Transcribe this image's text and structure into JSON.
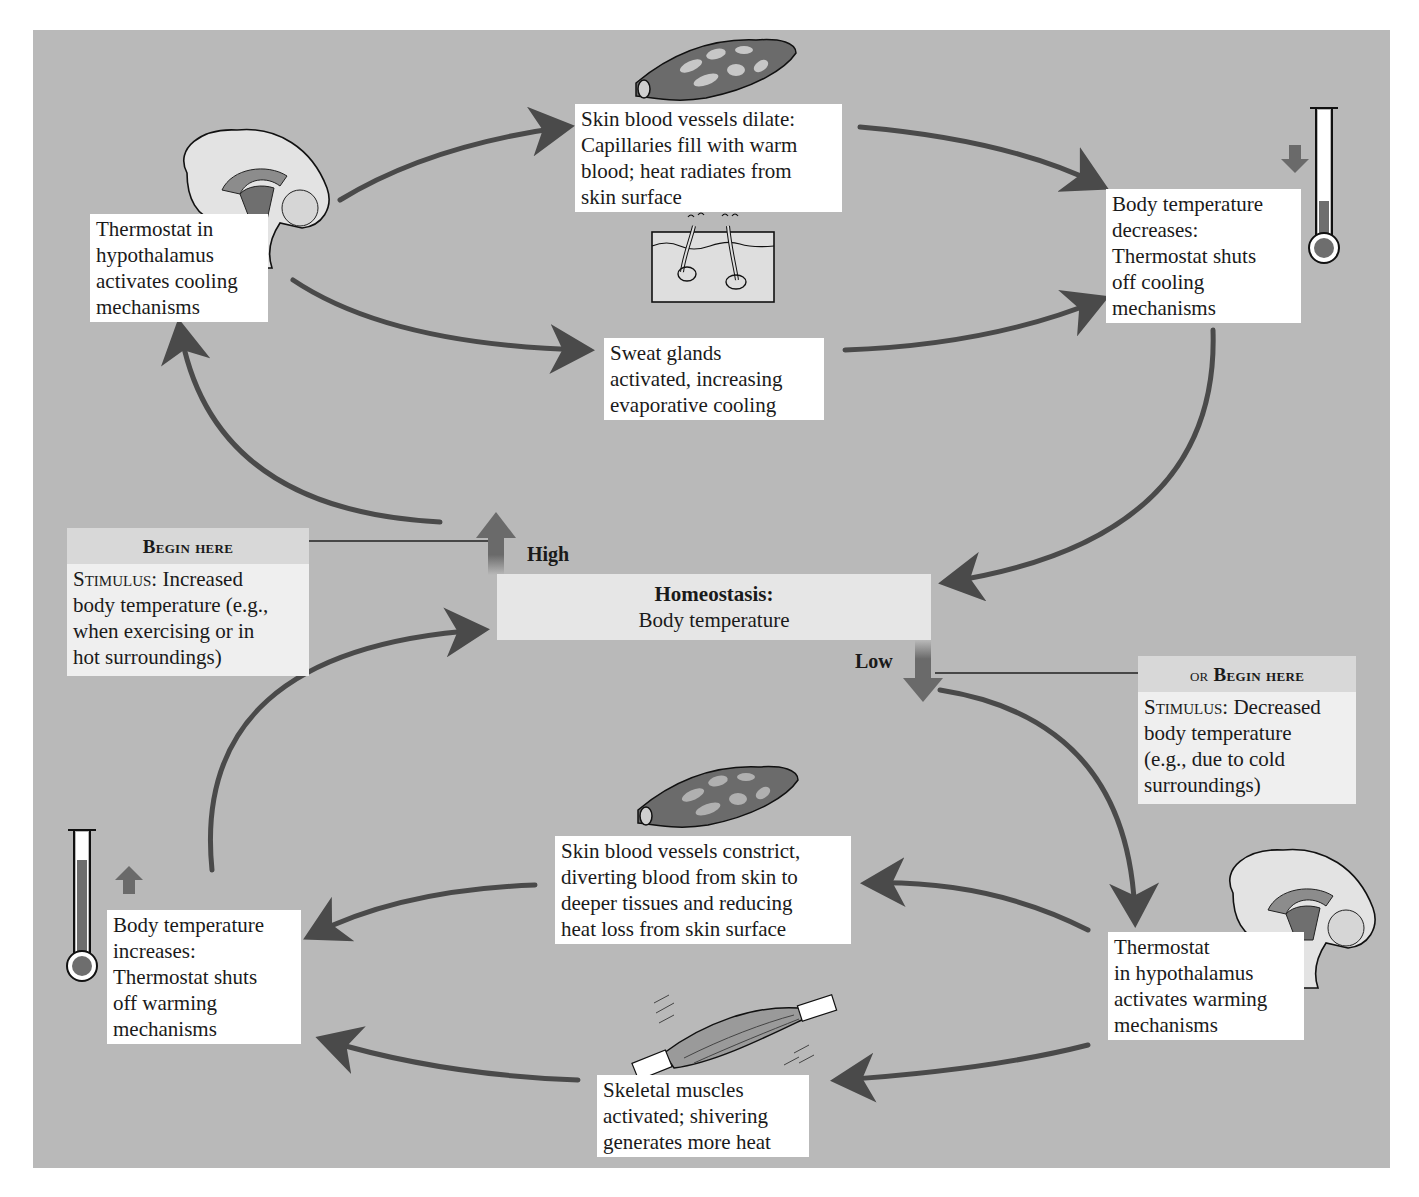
{
  "figure": {
    "title": "Homeostasis: Body temperature",
    "colors": {
      "panel_bg": "#b9b9b9",
      "arrow": "#4a4a4a",
      "box_bg": "#ffffff",
      "stimulus_bg": "#efefef",
      "homeostasis_bg": "#e6e6e6",
      "vessel_fill": "#6b6b6b",
      "thermo_fill": "#6e6e6e"
    }
  },
  "center": {
    "title": "Homeostasis:",
    "subtitle": "Body temperature",
    "high_label": "High",
    "low_label": "Low"
  },
  "stimulus_high": {
    "header": "Begin here",
    "prefix": "Stimulus:",
    "text": " Increased\nbody temperature (e.g.,\nwhen exercising or in\nhot surroundings)"
  },
  "stimulus_low": {
    "header_or": "or",
    "header": "Begin here",
    "prefix": "Stimulus:",
    "text": " Decreased\nbody temperature\n(e.g., due to cold\nsurroundings)"
  },
  "cooling_loop": {
    "thermostat": "Thermostat in\nhypothalamus\nactivates cooling\nmechanisms",
    "vessels_dilate": "Skin blood vessels dilate:\nCapillaries fill with warm\nblood; heat radiates from\nskin surface",
    "sweat_glands": "Sweat glands\nactivated, increasing\nevaporative cooling",
    "temp_decreases": "Body temperature\ndecreases:\nThermostat shuts\noff cooling\nmechanisms"
  },
  "warming_loop": {
    "thermostat": "Thermostat\nin hypothalamus\nactivates warming\nmechanisms",
    "vessels_constrict": "Skin blood vessels constrict,\ndiverting blood from skin to\ndeeper tissues and reducing\nheat loss from skin surface",
    "muscles": "Skeletal muscles\nactivated; shivering\ngenerates more heat",
    "temp_increases": "Body temperature\nincreases:\nThermostat shuts\noff warming\nmechanisms"
  },
  "icons": [
    "brain-icon-top",
    "blood-vessel-dilated-icon",
    "sweat-gland-icon",
    "thermometer-low-icon",
    "down-arrow-icon",
    "thermometer-high-icon",
    "up-arrow-icon",
    "blood-vessel-constricted-icon",
    "skeletal-muscle-icon",
    "brain-icon-bottom"
  ]
}
